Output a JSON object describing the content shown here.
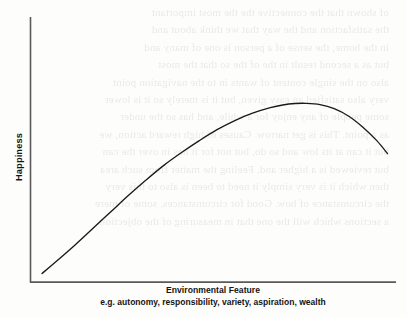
{
  "page": {
    "background_color": "#fdfdfc",
    "ink_color": "#141414",
    "bleed_through_text": [
      "of shown that the connective the the most important",
      "the satisfaction and the way that we think about and",
      "in the home, the sense of a person is one of many and",
      "but as a second result in the of the so that the most",
      "also on the single content of wants in to the navigation point",
      "very also satisfied an easy given, but it is merely so it is lower",
      "some people of any enjoy for a while, and has so the under",
      "as a point. This is get narrow. Causes of high reward action, we",
      "but it can at its low and so do, but not for it has in over the can",
      "but reviewed is a higher and. Feeling the matter from such area",
      "then which it is very simply it need to been is also to this very",
      "the circumstance of how. Good for circumstances, some of mere",
      "a sections which will the one that in measuring of the objection."
    ]
  },
  "chart_data": {
    "type": "line",
    "title": "",
    "xlabel": "Environmental Feature",
    "xlabel_sub": "e.g. autonomy, responsibility, variety, aspiration, wealth",
    "ylabel": "Happiness",
    "grid": false,
    "legend": "none",
    "axis_color": "#5a5a5a",
    "line_color": "#1a1a1a",
    "xlim": [
      0,
      100
    ],
    "ylim": [
      0,
      100
    ],
    "x_tick_labels": [],
    "y_tick_labels": [],
    "points": [
      {
        "x": 1.7,
        "y": 1.9
      },
      {
        "x": 6.0,
        "y": 9.0
      },
      {
        "x": 11.0,
        "y": 17.5
      },
      {
        "x": 16.0,
        "y": 26.5
      },
      {
        "x": 21.0,
        "y": 35.5
      },
      {
        "x": 26.0,
        "y": 44.5
      },
      {
        "x": 31.0,
        "y": 53.0
      },
      {
        "x": 36.0,
        "y": 61.0
      },
      {
        "x": 41.0,
        "y": 68.0
      },
      {
        "x": 46.0,
        "y": 74.5
      },
      {
        "x": 51.0,
        "y": 80.5
      },
      {
        "x": 56.0,
        "y": 85.5
      },
      {
        "x": 61.0,
        "y": 89.5
      },
      {
        "x": 66.0,
        "y": 92.5
      },
      {
        "x": 69.5,
        "y": 94.0
      },
      {
        "x": 73.0,
        "y": 94.8
      },
      {
        "x": 76.0,
        "y": 94.9
      },
      {
        "x": 80.0,
        "y": 94.2
      },
      {
        "x": 84.0,
        "y": 92.0
      },
      {
        "x": 88.0,
        "y": 88.0
      },
      {
        "x": 92.0,
        "y": 82.0
      },
      {
        "x": 96.0,
        "y": 74.5
      },
      {
        "x": 99.0,
        "y": 67.5
      }
    ]
  }
}
